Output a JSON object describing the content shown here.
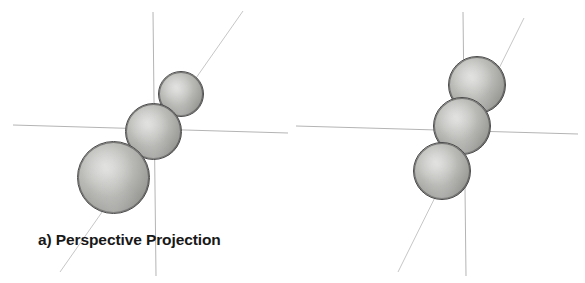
{
  "figure": {
    "width": 585,
    "height": 283,
    "background": "#ffffff"
  },
  "panels": [
    {
      "id": "perspective",
      "caption": "a) Perspective Projection",
      "description": "Three spheres of increasing apparent size receding toward the viewer along a diagonal axis",
      "axes": {
        "stroke": "#b4b4b4",
        "origin": {
          "x": 154,
          "y": 128
        },
        "lines": [
          {
            "name": "vertical-axis",
            "x1": 153,
            "y1": 12,
            "x2": 156,
            "y2": 276
          },
          {
            "name": "horizontal-axis",
            "x1": 13,
            "y1": 125,
            "x2": 288,
            "y2": 133
          },
          {
            "name": "depth-axis",
            "x1": 243,
            "y1": 11,
            "x2": 60,
            "y2": 272
          }
        ]
      },
      "spheres": [
        {
          "name": "sphere-far",
          "cx": 181,
          "cy": 94,
          "d": 46,
          "fill": "#b0b0ad"
        },
        {
          "name": "sphere-middle",
          "cx": 153,
          "cy": 131,
          "d": 57,
          "fill": "#b0b0ad"
        },
        {
          "name": "sphere-near",
          "cx": 113,
          "cy": 177,
          "d": 73,
          "fill": "#b0b0ad"
        }
      ]
    },
    {
      "id": "orthographic",
      "caption": "b) Orthographic Projection",
      "description": "Three spheres of identical size arranged along the same diagonal axis with no foreshortening",
      "axes": {
        "stroke": "#b4b4b4",
        "origin": {
          "x": 463,
          "y": 130
        },
        "lines": [
          {
            "name": "vertical-axis",
            "x1": 463,
            "y1": 12,
            "x2": 466,
            "y2": 276
          },
          {
            "name": "horizontal-axis",
            "x1": 296,
            "y1": 126,
            "x2": 578,
            "y2": 134
          },
          {
            "name": "depth-axis",
            "x1": 524,
            "y1": 18,
            "x2": 398,
            "y2": 272
          }
        ]
      },
      "spheres": [
        {
          "name": "sphere-far",
          "cx": 477,
          "cy": 85,
          "d": 58,
          "fill": "#b0b0ad"
        },
        {
          "name": "sphere-middle",
          "cx": 462,
          "cy": 126,
          "d": 58,
          "fill": "#b0b0ad"
        },
        {
          "name": "sphere-near",
          "cx": 442,
          "cy": 171,
          "d": 58,
          "fill": "#b0b0ad"
        }
      ]
    }
  ],
  "colors": {
    "background": "#ffffff",
    "axis_line": "#b4b4b4",
    "sphere_light": "#d8d8d6",
    "sphere_dark": "#868683",
    "sphere_outline": "#4a4a4a",
    "caption_text": "#181818"
  }
}
